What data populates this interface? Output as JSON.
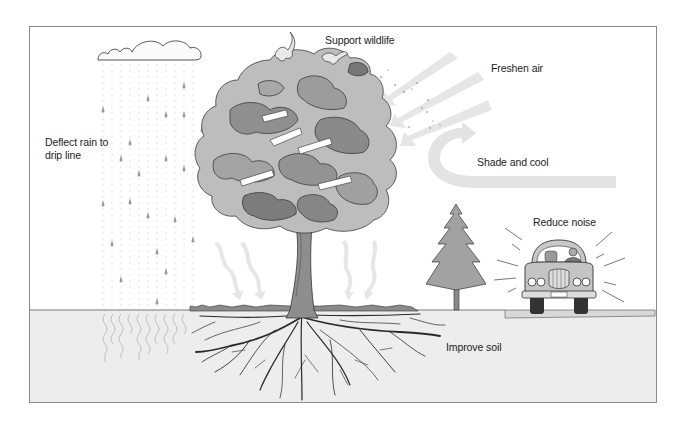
{
  "diagram": {
    "type": "illustration",
    "labels": {
      "deflect_rain": "Deflect rain to drip line",
      "support_wildlife": "Support wildlife",
      "freshen_air": "Freshen air",
      "shade_cool": "Shade and cool",
      "reduce_noise": "Reduce noise",
      "improve_soil": "Improve soil"
    },
    "elements": [
      "cloud",
      "rain",
      "deciduous-tree",
      "birds",
      "air-arrows",
      "shade-arrow",
      "evergreen-tree",
      "car-with-driver",
      "noise-lines",
      "roots",
      "water-infiltration",
      "ground"
    ],
    "colors": {
      "foliage_light": "#b9b9b9",
      "foliage_mid": "#9a9a9a",
      "foliage_dark": "#6f6f6f",
      "arrow": "#e4e4e4",
      "soil": "#ececec",
      "outline": "#333333"
    }
  }
}
